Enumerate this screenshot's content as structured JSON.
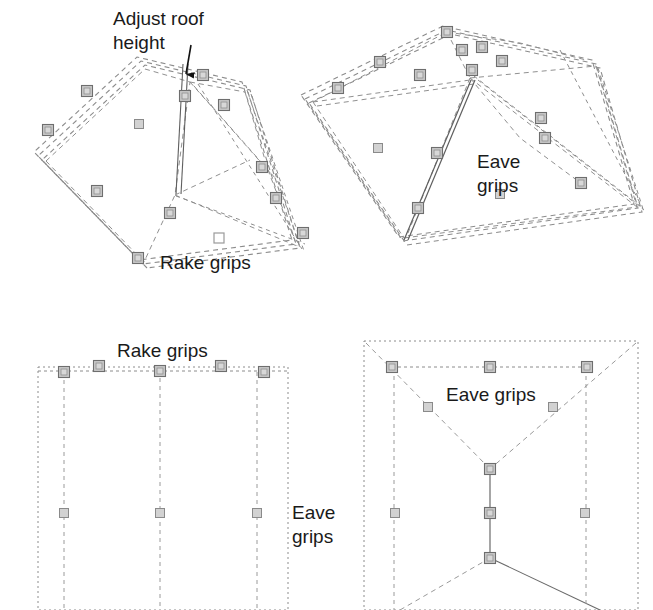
{
  "figure": {
    "background_color": "#ffffff",
    "line_color": "#808080",
    "solid_line_color": "#606060",
    "grip_fill": "#c8c8c8",
    "grip_stroke": "#7a7a7a",
    "text_color": "#1a1a1a"
  },
  "annotations": {
    "adjust_roof_height_line1": "Adjust roof",
    "adjust_roof_height_line2": "height",
    "rake_grips_iso": "Rake grips",
    "eave_grips_iso_line1": "Eave",
    "eave_grips_iso_line2": "grips",
    "rake_grips_plan": "Rake grips",
    "eave_grips_plan_line1": "Eave",
    "eave_grips_plan_line2": "grips",
    "eave_grips_hip_plan": "Eave grips"
  },
  "panels": [
    {
      "name": "hip-roof-isometric",
      "label_refs": [
        "adjust_roof_height_line1",
        "adjust_roof_height_line2",
        "rake_grips_iso"
      ],
      "grip_count": 11,
      "has_callout_arrow": true
    },
    {
      "name": "gable-roof-isometric",
      "label_refs": [
        "eave_grips_iso_line1",
        "eave_grips_iso_line2"
      ],
      "grip_count": 13,
      "has_callout_arrow": false
    },
    {
      "name": "gable-roof-plan",
      "label_refs": [
        "rake_grips_plan",
        "eave_grips_plan_line1",
        "eave_grips_plan_line2"
      ],
      "grip_count": 8,
      "has_callout_arrow": false
    },
    {
      "name": "hip-roof-plan",
      "label_refs": [
        "eave_grips_hip_plan"
      ],
      "grip_count": 10,
      "has_callout_arrow": false
    }
  ]
}
